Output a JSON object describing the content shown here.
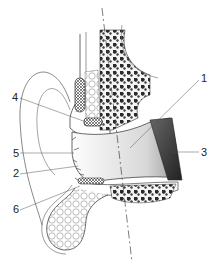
{
  "figure": {
    "labels": [
      {
        "id": "1",
        "text": "1",
        "x": 201,
        "y": 73
      },
      {
        "id": "2",
        "text": "2",
        "x": 13,
        "y": 168
      },
      {
        "id": "3",
        "text": "3",
        "x": 201,
        "y": 147
      },
      {
        "id": "4",
        "text": "4",
        "x": 12,
        "y": 92
      },
      {
        "id": "5",
        "text": "5",
        "x": 13,
        "y": 148
      },
      {
        "id": "6",
        "text": "6",
        "x": 13,
        "y": 204
      }
    ],
    "colors": {
      "line": "#333333",
      "bone": "#3a3a3a",
      "background": "#ffffff"
    }
  }
}
